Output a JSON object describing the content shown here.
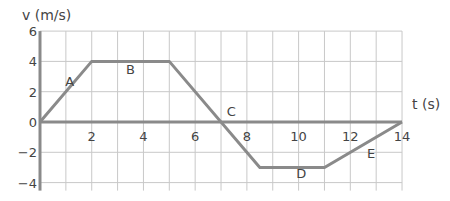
{
  "chart_data": {
    "type": "line",
    "title": "",
    "xlabel": "t (s)",
    "ylabel": "v (m/s)",
    "xlim": [
      0,
      14
    ],
    "ylim": [
      -4,
      6
    ],
    "grid": true,
    "x_ticks": [
      2,
      4,
      6,
      8,
      10,
      12,
      14
    ],
    "y_ticks": [
      6,
      4,
      2,
      0,
      -2,
      -4
    ],
    "y_tick_labels": [
      "6",
      "4",
      "2",
      "0",
      "−2",
      "−4"
    ],
    "series": [
      {
        "name": "velocity",
        "x": [
          0,
          2,
          5,
          8.5,
          11,
          14
        ],
        "y": [
          0,
          4,
          4,
          -3,
          -3,
          0
        ]
      }
    ],
    "segment_labels": [
      {
        "text": "A",
        "x": 1.15,
        "y": 2.4
      },
      {
        "text": "B",
        "x": 3.5,
        "y": 3.2
      },
      {
        "text": "C",
        "x": 7.4,
        "y": 0.4
      },
      {
        "text": "D",
        "x": 10.1,
        "y": -3.7
      },
      {
        "text": "E",
        "x": 12.8,
        "y": -2.4
      }
    ],
    "colors": {
      "line": "#8a8a8a",
      "axis": "#8a8a8a",
      "grid": "#c8c8c8",
      "text": "#444444"
    }
  }
}
